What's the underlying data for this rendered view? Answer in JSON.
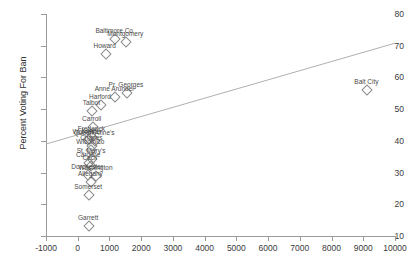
{
  "chart_data": {
    "type": "scatter",
    "title": "",
    "xlabel": "",
    "ylabel": "Percent Voting For Ban",
    "xlim": [
      -1000,
      10000
    ],
    "ylim": [
      10,
      80
    ],
    "xticks": [
      -1000,
      0,
      1000,
      2000,
      3000,
      4000,
      5000,
      6000,
      7000,
      8000,
      9000,
      10000
    ],
    "yticks": [
      10,
      20,
      30,
      40,
      50,
      60,
      70,
      80
    ],
    "grid": false,
    "legend": "none",
    "marker": "open-diamond",
    "points": [
      {
        "label": "Baltimore Co",
        "x": 1150,
        "y": 72.3
      },
      {
        "label": "Montgomery",
        "x": 1500,
        "y": 71.5
      },
      {
        "label": "Howard",
        "x": 850,
        "y": 67.6
      },
      {
        "label": "Pr. Georges",
        "x": 1520,
        "y": 55.3
      },
      {
        "label": "Anne Arundel",
        "x": 1150,
        "y": 54.0
      },
      {
        "label": "Harford",
        "x": 700,
        "y": 51.5
      },
      {
        "label": "Talbot",
        "x": 430,
        "y": 49.8
      },
      {
        "label": "Carroll",
        "x": 440,
        "y": 44.6
      },
      {
        "label": "Frederick",
        "x": 430,
        "y": 41.6
      },
      {
        "label": "Kent",
        "x": 330,
        "y": 41.0
      },
      {
        "label": "Worcester",
        "x": 300,
        "y": 40.6
      },
      {
        "label": "Queen Anne's",
        "x": 520,
        "y": 40.2
      },
      {
        "label": "Charles",
        "x": 430,
        "y": 38.6
      },
      {
        "label": "Wicomico",
        "x": 400,
        "y": 37.4
      },
      {
        "label": "St. Mary's",
        "x": 420,
        "y": 34.6
      },
      {
        "label": "Caroline",
        "x": 330,
        "y": 33.4
      },
      {
        "label": "Cecil",
        "x": 380,
        "y": 32.4
      },
      {
        "label": "Dorchester",
        "x": 300,
        "y": 29.6
      },
      {
        "label": "Washington",
        "x": 560,
        "y": 29.2
      },
      {
        "label": "Allegany",
        "x": 400,
        "y": 27.4
      },
      {
        "label": "Somerset",
        "x": 330,
        "y": 23.4
      },
      {
        "label": "Garrett",
        "x": 330,
        "y": 13.4
      },
      {
        "label": "Balt City",
        "x": 9100,
        "y": 56.4
      }
    ],
    "regression_line": {
      "x0": -1000,
      "y0": 39.0,
      "x1": 10000,
      "y1": 70.8
    }
  },
  "colors": {
    "axis": "#9a9a9a",
    "marker_stroke": "#8c8c8c",
    "label_text": "#4a4a4a",
    "regression": "#b0b0b0",
    "background": "#ffffff"
  }
}
